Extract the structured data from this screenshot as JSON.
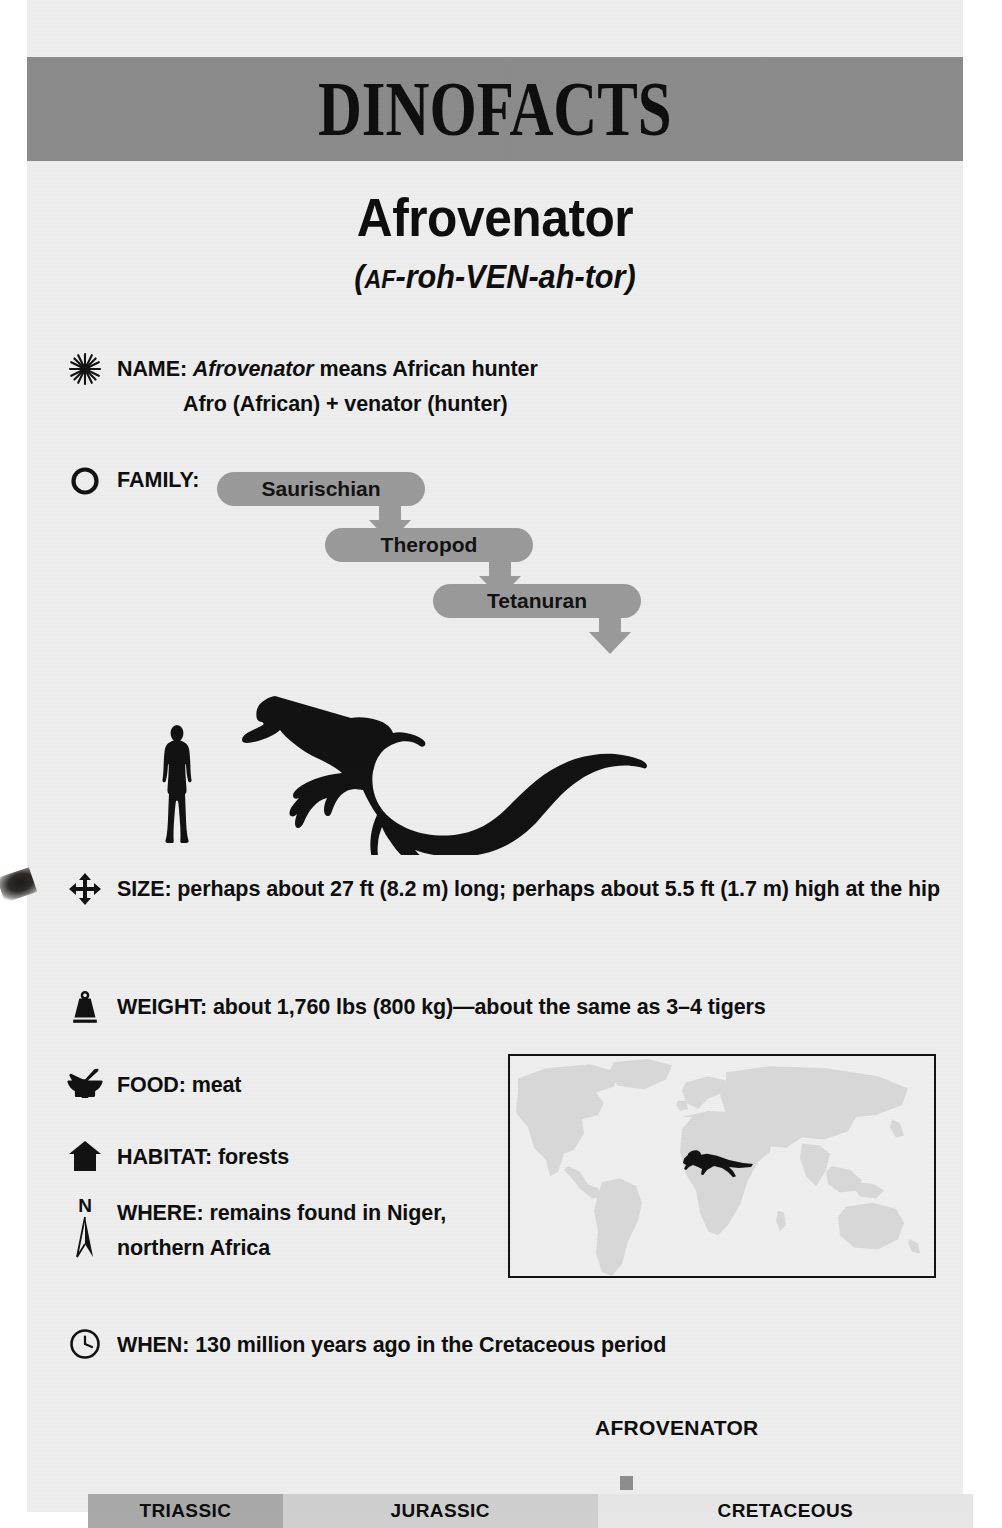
{
  "header": {
    "title": "DINOFACTS",
    "band_color": "#8b8b8b"
  },
  "dinosaur": {
    "name": "Afrovenator",
    "pronunciation_prefix": "(",
    "pronunciation_small": "AF",
    "pronunciation_rest": "-roh-VEN-ah-tor)"
  },
  "facts": {
    "name": {
      "icon": "starburst-icon",
      "label": "NAME:",
      "value_italic": "Afrovenator",
      "value_rest": " means African hunter",
      "line2": "Afro (African) + venator (hunter)"
    },
    "family": {
      "icon": "circle-icon",
      "label": "FAMILY:",
      "chain": [
        "Saurischian",
        "Theropod",
        "Tetanuran"
      ]
    },
    "size": {
      "icon": "four-arrows-icon",
      "text": "SIZE: perhaps about 27 ft (8.2 m) long; perhaps about 5.5 ft (1.7 m) high at the hip"
    },
    "weight": {
      "icon": "weight-icon",
      "text": "WEIGHT: about 1,760 lbs (800 kg)—about the same as 3–4 tigers"
    },
    "food": {
      "icon": "mortar-pestle-icon",
      "text": "FOOD: meat"
    },
    "habitat": {
      "icon": "house-icon",
      "text": "HABITAT: forests"
    },
    "where": {
      "icon": "compass-north-icon",
      "compass_letter": "N",
      "line1": "WHERE: remains found in Niger,",
      "line2": "northern Africa"
    },
    "when": {
      "icon": "clock-icon",
      "text": "WHEN: 130 million years ago in the Cretaceous period"
    }
  },
  "map": {
    "marker": "dinosaur-marker-icon",
    "land_color": "#d8d8d8",
    "ocean_color": "#efefef"
  },
  "timeline": {
    "marker_label": "AFROVENATOR",
    "eras": [
      {
        "label": "TRIASSIC",
        "color": "#a9a9a9",
        "width_pct": 22.0
      },
      {
        "label": "JURASSIC",
        "color": "#cfcfcf",
        "width_pct": 35.6
      },
      {
        "label": "CRETACEOUS",
        "color": "#e6e6e6",
        "width_pct": 42.4
      }
    ]
  }
}
